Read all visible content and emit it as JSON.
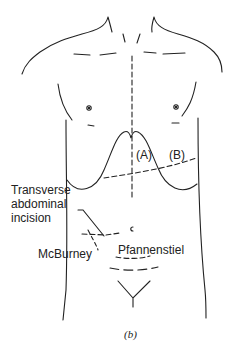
{
  "diagram": {
    "labels": {
      "a": "(A)",
      "b": "(B)",
      "transverse": [
        "Transverse",
        "abdominal",
        "incision"
      ],
      "mcburney": "McBurney",
      "pfannenstiel": "Pfannenstiel",
      "umbilicus": "c"
    },
    "caption": "(b)",
    "colors": {
      "line": "#222222",
      "background": "#ffffff"
    }
  }
}
